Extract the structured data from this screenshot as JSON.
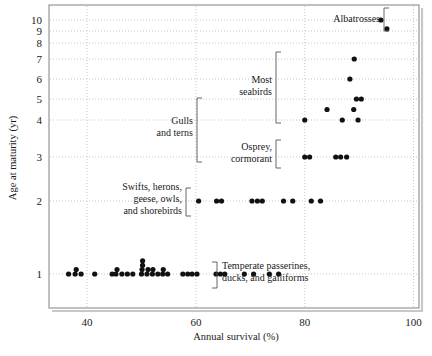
{
  "chart_data": {
    "type": "scatter",
    "title": "",
    "xlabel": "Annual survival (%)",
    "ylabel": "Age at maturity (yr)",
    "xlim": [
      33,
      101
    ],
    "ylim": [
      0.78,
      10.6
    ],
    "yscale": "log-like (compressed at high values)",
    "grid": true,
    "legend_position": "none",
    "xticks": [
      40,
      60,
      80,
      100
    ],
    "yticks": [
      1,
      2,
      3,
      4,
      5,
      6,
      7,
      8,
      9,
      10
    ],
    "xtick_labels": [
      "40",
      "60",
      "80",
      "100"
    ],
    "ytick_labels": [
      "1",
      "2",
      "3",
      "4",
      "5",
      "6",
      "7",
      "8",
      "9",
      "10"
    ],
    "point_color": "#111111",
    "points": [
      [
        36.6,
        1
      ],
      [
        37.8,
        1
      ],
      [
        38.0,
        1.06
      ],
      [
        38.9,
        1
      ],
      [
        41.4,
        1
      ],
      [
        44.6,
        1
      ],
      [
        45.3,
        1
      ],
      [
        45.5,
        1.06
      ],
      [
        46.4,
        1
      ],
      [
        47.4,
        1
      ],
      [
        48.4,
        1
      ],
      [
        50.0,
        1
      ],
      [
        50.1,
        1.06
      ],
      [
        50.2,
        1.12
      ],
      [
        50.2,
        1.18
      ],
      [
        51.0,
        1
      ],
      [
        51.2,
        1.06
      ],
      [
        52.0,
        1
      ],
      [
        52.1,
        1.06
      ],
      [
        53.0,
        1
      ],
      [
        53.9,
        1
      ],
      [
        54.0,
        1.06
      ],
      [
        54.8,
        1
      ],
      [
        57.6,
        1
      ],
      [
        58.5,
        1
      ],
      [
        59.3,
        1
      ],
      [
        60.2,
        1
      ],
      [
        63.7,
        1
      ],
      [
        64.5,
        1
      ],
      [
        65.3,
        1
      ],
      [
        68.9,
        1
      ],
      [
        70.6,
        1
      ],
      [
        73.5,
        1
      ],
      [
        75.2,
        1
      ],
      [
        60.5,
        2
      ],
      [
        63.8,
        2
      ],
      [
        64.7,
        2
      ],
      [
        70.3,
        2
      ],
      [
        71.3,
        2
      ],
      [
        72.2,
        2
      ],
      [
        76.1,
        2
      ],
      [
        77.8,
        2
      ],
      [
        81.2,
        2
      ],
      [
        82.9,
        2
      ],
      [
        80.0,
        3
      ],
      [
        80.9,
        3
      ],
      [
        85.7,
        3
      ],
      [
        86.6,
        3
      ],
      [
        87.7,
        3
      ],
      [
        80.0,
        4
      ],
      [
        86.9,
        4
      ],
      [
        89.8,
        4
      ],
      [
        84.1,
        4.5
      ],
      [
        89.0,
        4.5
      ],
      [
        89.5,
        5
      ],
      [
        90.4,
        5
      ],
      [
        88.3,
        6
      ],
      [
        89.1,
        7
      ],
      [
        94.0,
        10
      ],
      [
        95.1,
        9.2
      ]
    ],
    "annotations": [
      {
        "name": "albatrosses",
        "text": "Albatrosses",
        "lines": [
          "Albatrosses"
        ],
        "bracket": "right"
      },
      {
        "name": "most-seabirds",
        "text": "Most seabirds",
        "lines": [
          "Most",
          "seabirds"
        ],
        "bracket": "right"
      },
      {
        "name": "gulls-and-terns",
        "text": "Gulls and terns",
        "lines": [
          "Gulls",
          "and terns"
        ],
        "bracket": "right"
      },
      {
        "name": "osprey-cormorant",
        "text": "Osprey, cormorant",
        "lines": [
          "Osprey,",
          "cormorant"
        ],
        "bracket": "right"
      },
      {
        "name": "swifts-herons-geese-owls-shorebirds",
        "text": "Swifts, herons, geese, owls, and shorebirds",
        "lines": [
          "Swifts, herons,",
          "geese, owls,",
          "and shorebirds"
        ],
        "bracket": "right"
      },
      {
        "name": "temperate-passerines-ducks-galliforms",
        "text": "Temperate passerines, ducks, and galliforms",
        "lines": [
          "Temperate passerines,",
          "ducks, and galliforms"
        ],
        "bracket": "left"
      }
    ]
  },
  "axes": {
    "x_title": "Annual survival (%)",
    "y_title": "Age at maturity (yr)",
    "x_ticks": [
      "40",
      "60",
      "80",
      "100"
    ],
    "y_ticks": [
      "10",
      "9",
      "8",
      "7",
      "6",
      "5",
      "4",
      "3",
      "2",
      "1"
    ]
  },
  "labels": {
    "albatrosses": "Albatrosses",
    "most_seabirds_l1": "Most",
    "most_seabirds_l2": "seabirds",
    "gulls_l1": "Gulls",
    "gulls_l2": "and terns",
    "osprey_l1": "Osprey,",
    "osprey_l2": "cormorant",
    "swifts_l1": "Swifts, herons,",
    "swifts_l2": "geese, owls,",
    "swifts_l3": "and shorebirds",
    "passerines_l1": "Temperate passerines,",
    "passerines_l2": "ducks, and galliforms"
  }
}
